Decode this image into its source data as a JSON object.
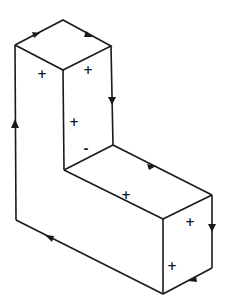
{
  "diagram": {
    "type": "isometric L-shaped solid with oriented boundary",
    "stroke_color": "#1a1a1a",
    "background": "#ffffff",
    "face_signs": [
      {
        "id": "top-left-face",
        "label": "+",
        "x": 42,
        "y": 76
      },
      {
        "id": "top-right-face",
        "label": "+",
        "x": 88,
        "y": 73
      },
      {
        "id": "inner-vertical-face",
        "label": "+",
        "x": 74,
        "y": 124
      },
      {
        "id": "inner-vertical-face-lower",
        "label": "-",
        "x": 86,
        "y": 151
      },
      {
        "id": "lower-top-face",
        "label": "+",
        "x": 126,
        "y": 197
      },
      {
        "id": "front-right-face-upper",
        "label": "+",
        "x": 190,
        "y": 224
      },
      {
        "id": "front-right-face-lower",
        "label": "+",
        "x": 172,
        "y": 268
      }
    ],
    "boundary_arrows": [
      {
        "id": "arrow-top-left-edge",
        "direction": "up-right"
      },
      {
        "id": "arrow-top-right-edge",
        "direction": "down-right"
      },
      {
        "id": "arrow-right-column-edge",
        "direction": "down"
      },
      {
        "id": "arrow-lower-top-edge",
        "direction": "down-right"
      },
      {
        "id": "arrow-far-right-edge",
        "direction": "down"
      },
      {
        "id": "arrow-bottom-right-edge",
        "direction": "down-left"
      },
      {
        "id": "arrow-bottom-left-edge",
        "direction": "up-left"
      },
      {
        "id": "arrow-left-edge",
        "direction": "up"
      }
    ]
  }
}
